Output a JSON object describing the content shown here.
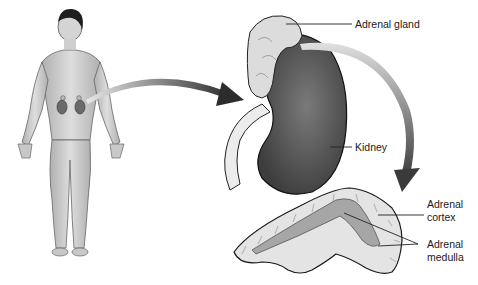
{
  "diagram": {
    "labels": {
      "adrenal_gland": "Adrenal gland",
      "kidney": "Kidney",
      "adrenal_cortex_line1": "Adrenal",
      "adrenal_cortex_line2": "cortex",
      "adrenal_medulla_line1": "Adrenal",
      "adrenal_medulla_line2": "medulla"
    },
    "panels": [
      {
        "id": "human-figure",
        "description": "Front view of male body with kidneys and adrenal glands shown"
      },
      {
        "id": "kidney-with-adrenal",
        "description": "Enlarged kidney with adrenal gland on top"
      },
      {
        "id": "adrenal-cross-section",
        "description": "Cross-section of adrenal gland showing cortex and medulla"
      }
    ],
    "colors": {
      "arrow": "#3c3c3c",
      "kidney": "#5a5a5a",
      "adrenal": "#d8d8d8",
      "skin": "#cfcfcf",
      "line": "#222222"
    }
  }
}
